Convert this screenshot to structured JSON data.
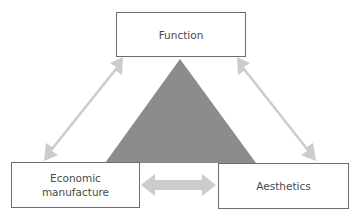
{
  "diagram": {
    "nodes": {
      "function": {
        "label": "Function"
      },
      "economic": {
        "label": "Economic\nmanufacture"
      },
      "aesthetics": {
        "label": "Aesthetics"
      }
    },
    "center_shape": "triangle",
    "edges": [
      {
        "from": "function",
        "to": "economic",
        "type": "bidirectional-arrow"
      },
      {
        "from": "function",
        "to": "aesthetics",
        "type": "bidirectional-arrow"
      },
      {
        "from": "economic",
        "to": "aesthetics",
        "type": "bidirectional-arrow"
      }
    ],
    "colors": {
      "triangle": "#8c8c8c",
      "arrows": "#cccccc",
      "box_border": "#6e6e6e",
      "text": "#4a4a4a"
    }
  }
}
